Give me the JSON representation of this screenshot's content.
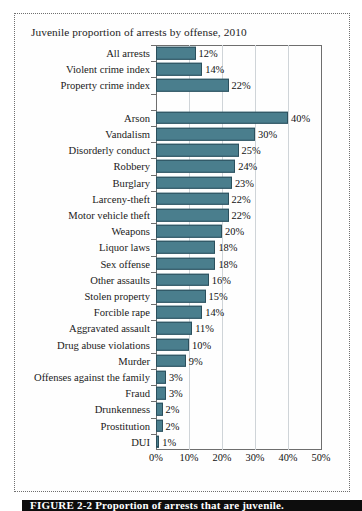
{
  "figure": {
    "title": "Juvenile proportion of arrests by offense, 2010",
    "caption": "FIGURE 2-2   Proportion of arrests that are juvenile."
  },
  "chart_data": {
    "type": "bar",
    "orientation": "horizontal",
    "title": "Juvenile proportion of arrests by offense, 2010",
    "xlabel": "",
    "ylabel": "",
    "xlim": [
      0,
      50
    ],
    "grid": true,
    "legend": "none",
    "xticks": [
      "0%",
      "10%",
      "20%",
      "30%",
      "40%",
      "50%"
    ],
    "xtick_values": [
      0,
      10,
      20,
      30,
      40,
      50
    ],
    "value_suffix": "%",
    "bar_color": "#4a7e8d",
    "bar_border_color": "#2b4f5c",
    "categories": [
      "All arrests",
      "Violent crime index",
      "Property crime index",
      "",
      "Arson",
      "Vandalism",
      "Disorderly conduct",
      "Robbery",
      "Burglary",
      "Larceny-theft",
      "Motor vehicle theft",
      "Weapons",
      "Liquor laws",
      "Sex offense",
      "Other assaults",
      "Stolen property",
      "Forcible rape",
      "Aggravated assault",
      "Drug abuse violations",
      "Murder",
      "Offenses against the family",
      "Fraud",
      "Drunkenness",
      "Prostitution",
      "DUI"
    ],
    "values": [
      12,
      14,
      22,
      null,
      40,
      30,
      25,
      24,
      23,
      22,
      22,
      20,
      18,
      18,
      16,
      15,
      14,
      11,
      10,
      9,
      3,
      3,
      2,
      2,
      1
    ],
    "labels": [
      "12%",
      "14%",
      "22%",
      "",
      "40%",
      "30%",
      "25%",
      "24%",
      "23%",
      "22%",
      "22%",
      "20%",
      "18%",
      "18%",
      "16%",
      "15%",
      "14%",
      "11%",
      "10%",
      "9%",
      "3%",
      "3%",
      "2%",
      "2%",
      "1%"
    ]
  }
}
